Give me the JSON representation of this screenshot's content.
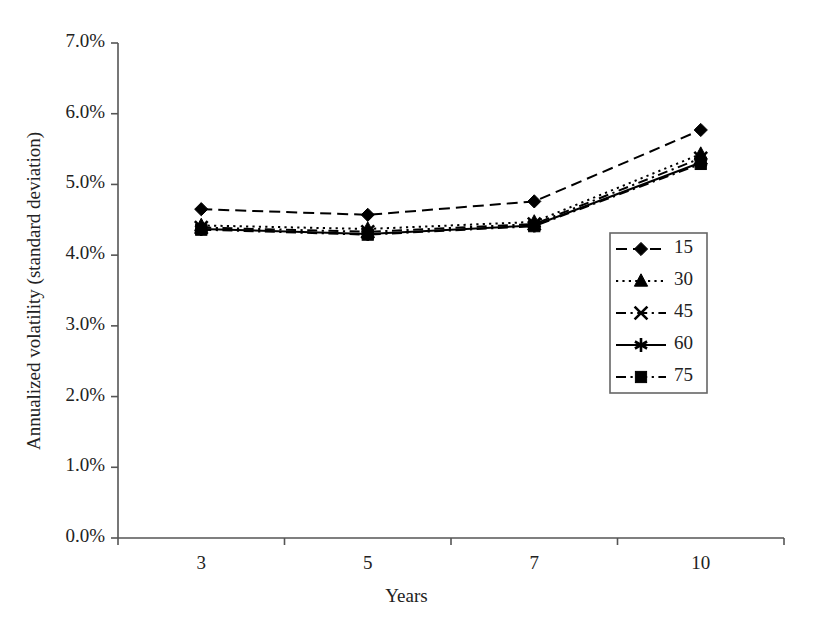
{
  "chart_data": {
    "type": "line",
    "title": "",
    "xlabel": "Years",
    "ylabel": "Annualized volatility (standard deviation)",
    "categories": [
      "3",
      "5",
      "7",
      "10"
    ],
    "x_tick_labels": [
      "3",
      "5",
      "7",
      "10"
    ],
    "y_tick_labels": [
      "0.0%",
      "1.0%",
      "2.0%",
      "3.0%",
      "4.0%",
      "5.0%",
      "6.0%",
      "7.0%"
    ],
    "y_tick_values": [
      0.0,
      1.0,
      2.0,
      3.0,
      4.0,
      5.0,
      6.0,
      7.0
    ],
    "ylim": [
      0.0,
      7.0
    ],
    "y_unit": "%",
    "grid": false,
    "legend_position": "center-right-inside",
    "series": [
      {
        "name": "15",
        "values": [
          4.65,
          4.57,
          4.76,
          5.77
        ],
        "marker": "diamond",
        "linestyle": "dashed",
        "color": "#000000"
      },
      {
        "name": "30",
        "values": [
          4.42,
          4.37,
          4.47,
          5.43
        ],
        "marker": "triangle",
        "linestyle": "dotted",
        "color": "#000000"
      },
      {
        "name": "45",
        "values": [
          4.39,
          4.33,
          4.44,
          5.37
        ],
        "marker": "x-cross",
        "linestyle": "dash-dot",
        "color": "#000000"
      },
      {
        "name": "60",
        "values": [
          4.37,
          4.3,
          4.42,
          5.31
        ],
        "marker": "star",
        "linestyle": "solid",
        "color": "#000000"
      },
      {
        "name": "75",
        "values": [
          4.36,
          4.29,
          4.41,
          5.29
        ],
        "marker": "square",
        "linestyle": "dash-dot",
        "color": "#000000"
      }
    ]
  },
  "axes": {
    "x_title": "Years",
    "y_title": "Annualized volatility (standard deviation)"
  },
  "legend": {
    "entries": [
      {
        "label": "15",
        "marker": "diamond",
        "linestyle": "dashed"
      },
      {
        "label": "30",
        "marker": "triangle",
        "linestyle": "dotted"
      },
      {
        "label": "45",
        "marker": "x-cross",
        "linestyle": "dash-dot"
      },
      {
        "label": "60",
        "marker": "star",
        "linestyle": "solid"
      },
      {
        "label": "75",
        "marker": "square",
        "linestyle": "dash-dot"
      }
    ]
  },
  "style": {
    "axis_color": "#555555",
    "line_color": "#000000",
    "background": "#ffffff",
    "legend_border": "#666666"
  }
}
